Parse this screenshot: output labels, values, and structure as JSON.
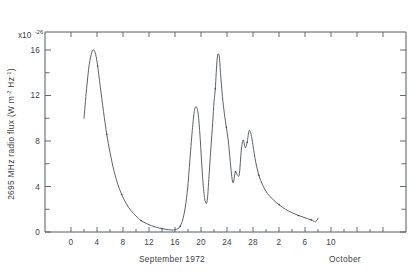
{
  "figure": {
    "name": "solar-radio-flux-timeseries",
    "background_color": "#ffffff",
    "line_color": "#4a4f54",
    "axis_color": "#555a5e"
  },
  "axes": {
    "y_title_prefix": "2695 MHz radio flux  (W m",
    "y_title_sup1": "-2",
    "y_title_mid": " Hz",
    "y_title_sup2": "-1",
    "y_title_suffix": ")",
    "y_multiplier_base": "x10",
    "y_multiplier_exp": "-26",
    "y_ticks": [
      "0",
      "4",
      "8",
      "12",
      "16"
    ],
    "x_ticks_september": [
      "0",
      "4",
      "8",
      "12",
      "16",
      "20",
      "24",
      "28"
    ],
    "x_ticks_october": [
      "2",
      "6",
      "10"
    ],
    "x_label_september": "September 1972",
    "x_label_october": "October"
  },
  "chart_data": {
    "type": "line",
    "title": "",
    "xlabel": "September 1972 / October",
    "ylabel": "2695 MHz radio flux (W m-2 Hz-1)",
    "y_multiplier": 1e-26,
    "grid": false,
    "legend": "none",
    "xlim": [
      -1.5,
      12.5
    ],
    "ylim": [
      0,
      17.5
    ],
    "x_axis_note": "Day of month; September days 0-30 continue into October days 1-12 on the same continuous scale",
    "x_tick_values": [
      0,
      4,
      8,
      12,
      16,
      20,
      24,
      28,
      32,
      36,
      40
    ],
    "x_tick_labels": [
      "0",
      "4",
      "8",
      "12",
      "16",
      "20",
      "24",
      "28",
      "2",
      "6",
      "10"
    ],
    "y_tick_values": [
      0,
      4,
      8,
      12,
      16
    ],
    "series": [
      {
        "name": "2695 MHz radio flux",
        "x": [
          2.0,
          2.4,
          2.8,
          3.2,
          3.5,
          3.8,
          4.1,
          4.5,
          5.0,
          5.5,
          6.0,
          6.6,
          7.2,
          7.8,
          8.5,
          9.2,
          10.0,
          10.8,
          11.6,
          12.4,
          13.2,
          14.0,
          15.0,
          16.0,
          16.8,
          17.4,
          17.9,
          18.3,
          18.7,
          19.0,
          19.3,
          19.6,
          19.9,
          20.2,
          20.5,
          20.8,
          21.0,
          21.2,
          21.5,
          21.8,
          22.0,
          22.2,
          22.5,
          22.8,
          23.0,
          23.3,
          23.6,
          23.9,
          24.2,
          24.5,
          24.8,
          25.0,
          25.3,
          25.6,
          25.9,
          26.2,
          26.5,
          26.8,
          27.1,
          27.4,
          27.7,
          28.0,
          28.4,
          28.9,
          29.5,
          30.2,
          31.0,
          32.0,
          33.0,
          34.0,
          35.0,
          36.0,
          37.0,
          37.6,
          38.0
        ],
        "y": [
          10.0,
          12.6,
          14.7,
          15.8,
          16.0,
          15.6,
          14.6,
          12.8,
          10.6,
          8.6,
          7.0,
          5.4,
          4.2,
          3.3,
          2.5,
          1.9,
          1.4,
          1.0,
          0.75,
          0.55,
          0.4,
          0.3,
          0.2,
          0.2,
          0.5,
          1.6,
          3.6,
          6.4,
          9.2,
          10.7,
          11.0,
          10.2,
          8.0,
          5.2,
          3.2,
          2.5,
          3.0,
          4.6,
          7.2,
          9.6,
          11.4,
          12.6,
          15.3,
          15.5,
          14.0,
          11.9,
          10.4,
          9.2,
          8.0,
          6.2,
          4.6,
          4.4,
          5.3,
          5.0,
          5.1,
          7.2,
          8.1,
          7.4,
          7.9,
          8.9,
          8.6,
          7.6,
          6.2,
          5.0,
          4.1,
          3.4,
          2.9,
          2.4,
          2.0,
          1.7,
          1.45,
          1.25,
          1.05,
          0.9,
          1.2
        ]
      }
    ],
    "features": [
      {
        "label": "first burst peak",
        "x": 3.5,
        "y": 16.0
      },
      {
        "label": "quiet minimum",
        "x": 15.5,
        "y": 0.2
      },
      {
        "label": "second burst peak",
        "x": 22.6,
        "y": 15.5
      },
      {
        "label": "third burst peak",
        "x": 27.4,
        "y": 8.9
      }
    ]
  }
}
